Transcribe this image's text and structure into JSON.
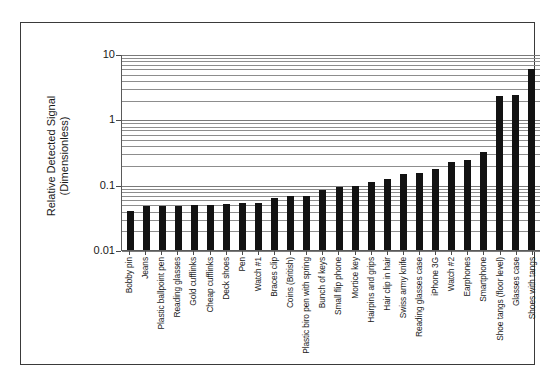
{
  "chart_data": {
    "type": "bar",
    "title": "",
    "xlabel": "",
    "ylabel": "Relative Detected Signal (Dimensionless)",
    "ylabel_line1": "Relative Detected Signal",
    "ylabel_line2": "(Dimensionless)",
    "yscale": "log",
    "ylim": [
      0.01,
      10
    ],
    "ytick_labels": [
      "10",
      "1",
      "0.1",
      "0.01"
    ],
    "ytick_values": [
      10,
      1,
      0.1,
      0.01
    ],
    "grid": true,
    "grid_style": "horizontal log minor gridlines",
    "legend": "none",
    "bar_color": "#121212",
    "categories": [
      "Bobby pin",
      "Jeans",
      "Plastic ballpoint pen",
      "Reading glasses",
      "Gold cufflinks",
      "Cheap cufflinks",
      "Deck shoes",
      "Pen",
      "Watch #1",
      "Braces clip",
      "Coins (British)",
      "Plastic biro pen with spring",
      "Bunch of keys",
      "Small flip phone",
      "Mortice key",
      "Hairpins and grips",
      "Hair clip in hair",
      "Swiss army knife",
      "Reading glasses case",
      "iPhone 3G",
      "Watch #2",
      "Earphones",
      "Smartphone",
      "Shoe tangs (floor level)",
      "Glasses case",
      "Shoes with tangs"
    ],
    "values": [
      0.04,
      0.048,
      0.048,
      0.048,
      0.049,
      0.049,
      0.051,
      0.052,
      0.053,
      0.062,
      0.068,
      0.068,
      0.083,
      0.093,
      0.095,
      0.108,
      0.122,
      0.145,
      0.152,
      0.175,
      0.225,
      0.235,
      0.32,
      2.3,
      2.35,
      6.0
    ]
  }
}
